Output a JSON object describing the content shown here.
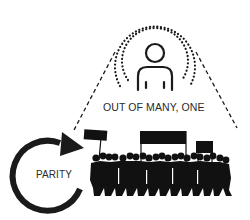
{
  "diagram": {
    "individual": {
      "icon": "person-icon",
      "halo": "dotted-concentric-arcs",
      "label": "OUT OF MANY, ONE"
    },
    "cycle": {
      "icon": "circular-arrow-icon",
      "label": "PARITY"
    },
    "crowd": {
      "icon": "protest-crowd-silhouette",
      "banners": 3
    },
    "connectors": "dashed-lines-from-individual-to-crowd",
    "colors": {
      "ink": "#1a1a1a",
      "text": "#2a2a2a",
      "background": "#ffffff"
    }
  }
}
